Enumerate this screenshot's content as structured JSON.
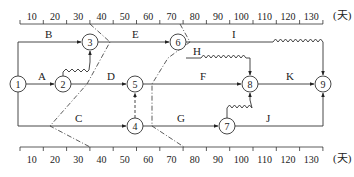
{
  "diagram": {
    "type": "time-scaled network (double-code) with front lines",
    "unit": "(天)",
    "scale": {
      "top_ticks": [
        "10",
        "20",
        "30",
        "40",
        "50",
        "60",
        "70",
        "80",
        "90",
        "100",
        "110",
        "120",
        "130"
      ],
      "bottom_ticks": [
        "10",
        "20",
        "30",
        "40",
        "50",
        "60",
        "70",
        "80",
        "90",
        "100",
        "110",
        "120",
        "130"
      ]
    },
    "nodes": [
      {
        "id": "1",
        "label": "1"
      },
      {
        "id": "2",
        "label": "2"
      },
      {
        "id": "3",
        "label": "3"
      },
      {
        "id": "4",
        "label": "4"
      },
      {
        "id": "5",
        "label": "5"
      },
      {
        "id": "6",
        "label": "6"
      },
      {
        "id": "7",
        "label": "7"
      },
      {
        "id": "8",
        "label": "8"
      },
      {
        "id": "9",
        "label": "9"
      }
    ],
    "activities": [
      {
        "label": "A",
        "from": "1",
        "to": "2"
      },
      {
        "label": "B",
        "from": "1",
        "to": "3"
      },
      {
        "label": "C",
        "from": "1",
        "to": "4"
      },
      {
        "label": "D",
        "from": "2",
        "to": "5"
      },
      {
        "label": "E",
        "from": "3",
        "to": "6"
      },
      {
        "label": "F",
        "from": "5",
        "to": "8"
      },
      {
        "label": "G",
        "from": "4",
        "to": "7"
      },
      {
        "label": "H",
        "from": "6",
        "to": "8"
      },
      {
        "label": "I",
        "from": "6",
        "to": "9"
      },
      {
        "label": "J",
        "from": "7",
        "to": "9"
      },
      {
        "label": "K",
        "from": "8",
        "to": "9"
      }
    ],
    "front_lines": [
      {
        "name": "check-line-35",
        "day": 35
      },
      {
        "name": "check-line-75",
        "day": 75
      }
    ]
  }
}
